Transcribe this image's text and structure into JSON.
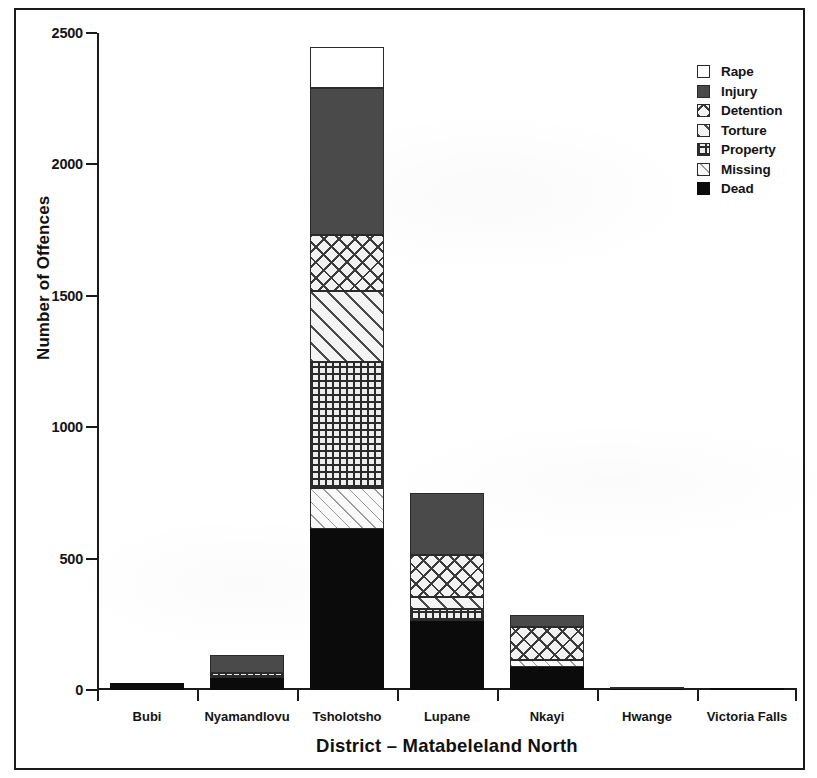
{
  "chart_data": {
    "type": "bar",
    "subtype": "stacked",
    "title": "",
    "xlabel": "District – Matabeleland North",
    "ylabel": "Number of Offences",
    "ylim": [
      0,
      2500
    ],
    "yticks": [
      0,
      500,
      1000,
      1500,
      2000,
      2500
    ],
    "ytick_labels": [
      "0",
      "500",
      "1000",
      "1500",
      "2000",
      "2500"
    ],
    "grid": false,
    "legend_position": "top-right",
    "categories": [
      "Bubi",
      "Nyamandlovu",
      "Tsholotsho",
      "Lupane",
      "Nkayi",
      "Hwange",
      "Victoria Falls"
    ],
    "series": [
      {
        "name": "Dead",
        "values": [
          25,
          45,
          612,
          263,
          88,
          4,
          6
        ]
      },
      {
        "name": "Missing",
        "values": [
          0,
          0,
          156,
          0,
          26,
          0,
          0
        ]
      },
      {
        "name": "Property",
        "values": [
          0,
          20,
          479,
          44,
          0,
          4,
          0
        ]
      },
      {
        "name": "Torture",
        "values": [
          0,
          0,
          270,
          46,
          0,
          0,
          0
        ]
      },
      {
        "name": "Detention",
        "values": [
          0,
          0,
          213,
          160,
          126,
          0,
          0
        ]
      },
      {
        "name": "Injury",
        "values": [
          0,
          68,
          559,
          236,
          45,
          0,
          0
        ]
      },
      {
        "name": "Rape",
        "values": [
          0,
          0,
          156,
          0,
          0,
          0,
          0
        ]
      }
    ],
    "totals": [
      25,
      133,
      2445,
      749,
      285,
      8,
      6
    ]
  },
  "axes": {
    "y_label": "Number of Offences",
    "x_label": "District – Matabeleland North",
    "y_ticks": [
      {
        "value": 2500,
        "label": "2500"
      },
      {
        "value": 2000,
        "label": "2000"
      },
      {
        "value": 1500,
        "label": "1500"
      },
      {
        "value": 1000,
        "label": "1000"
      },
      {
        "value": 500,
        "label": "500"
      },
      {
        "value": 0,
        "label": "0"
      }
    ],
    "x_ticks": [
      {
        "label": "Bubi"
      },
      {
        "label": "Nyamandlovu"
      },
      {
        "label": "Tsholotsho"
      },
      {
        "label": "Lupane"
      },
      {
        "label": "Nkayi"
      },
      {
        "label": "Hwange"
      },
      {
        "label": "Victoria Falls"
      }
    ]
  },
  "legend": {
    "items": [
      {
        "label": "Rape",
        "pattern": "solid-white",
        "color": "#ffffff"
      },
      {
        "label": "Injury",
        "pattern": "solid-gray",
        "color": "#4a4a4a"
      },
      {
        "label": "Detention",
        "pattern": "cross-diagonal",
        "color": "#3b3b3b"
      },
      {
        "label": "Torture",
        "pattern": "diagonal",
        "color": "#4a4a4a"
      },
      {
        "label": "Property",
        "pattern": "grid",
        "color": "#2b2b2b"
      },
      {
        "label": "Missing",
        "pattern": "sparse-diagonal",
        "color": "#9a9a9a"
      },
      {
        "label": "Dead",
        "pattern": "solid-black",
        "color": "#0b0b0b"
      }
    ]
  },
  "colors": {
    "axis": "#1a1a1a",
    "frame": "#1a1a1a",
    "background": "#ffffff"
  }
}
